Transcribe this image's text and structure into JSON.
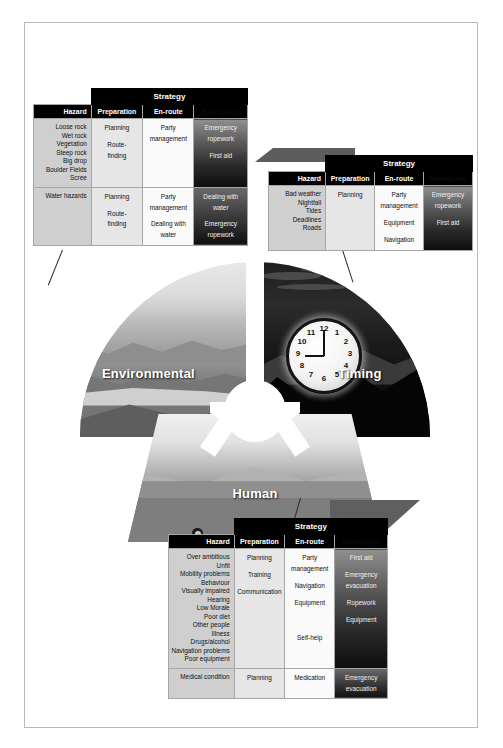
{
  "figure": {
    "segments": [
      {
        "id": "environmental",
        "label": "Environmental"
      },
      {
        "id": "timing",
        "label": "Timing"
      },
      {
        "id": "human",
        "label": "Human"
      }
    ],
    "clock": {
      "numbers": [
        "12",
        "1",
        "2",
        "3",
        "4",
        "5",
        "6",
        "7",
        "8",
        "9",
        "10",
        "11"
      ]
    }
  },
  "table_headers": {
    "strategy": "Strategy",
    "hazard": "Hazard",
    "preparation": "Preparation",
    "en_route": "En-route",
    "emergency": "Emergency"
  },
  "tables": {
    "environmental": {
      "rows": [
        {
          "hazard": "Loose rock\nWet rock\nVegetation\nSteep rock\nBig drop\nBoulder Fields\nScree",
          "preparation": "Planning\n\nRoute-\nfinding",
          "en_route": "Party\nmanagement",
          "emergency": "Emergency\nropework\n\nFirst aid"
        },
        {
          "hazard": "Water hazards",
          "preparation": "Planning\n\nRoute-\nfinding",
          "en_route": "Party\nmanagement\n\nDealing with\nwater",
          "emergency": "Dealing with\nwater\n\nEmergency\nropework"
        }
      ]
    },
    "timing": {
      "rows": [
        {
          "hazard": "Bad weather\nNightfall\nTides\nDeadlines\nRoads",
          "preparation": "Planning",
          "en_route": "Party\nmanagement\n\nEquipment\n\nNavigation",
          "emergency": "Emergency\nropework\n\nFirst aid"
        }
      ]
    },
    "human": {
      "rows": [
        {
          "hazard": "Over ambitious\nUnfit\nMobility problems\nBehaviour\nVisually impaired\nHearing\nLow Morale\nPoor diet\nOther people\nIllness\nDrugs/alcohol\nNavigation problems\nPoor equipment",
          "preparation": "Planning\n\nTraining\n\nCommunication",
          "en_route": "Party\nmanagement\n\nNavigation\n\nEquipment\n\n\n\n\nSelf-help",
          "emergency": "First aid\n\nEmergency\nevacuation\n\nRopework\n\nEquipment"
        },
        {
          "hazard": "Medical condition",
          "preparation": "Planning",
          "en_route": "Medication",
          "emergency": "Emergency\nevacuation"
        }
      ]
    }
  },
  "colors": {
    "header_bg": "#000000",
    "hazard_bg": "#cfcfcf",
    "preparation_bg": "#e6e6e6",
    "en_route_bg": "#fafafa",
    "emergency_bg": "#2a2a2a",
    "frame_border": "#b9b9b9"
  }
}
